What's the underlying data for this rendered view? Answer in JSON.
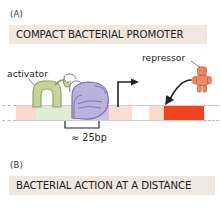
{
  "figure": {
    "width": 221,
    "height": 209,
    "background": "#ffffff"
  },
  "panels": [
    {
      "id": "A",
      "letter": "(A)",
      "banner_text": "COMPACT BACTERIAL PROMOTER",
      "banner_color": "#f0e7df"
    },
    {
      "id": "B",
      "letter": "(B)",
      "banner_text": "BACTERIAL ACTION AT A DISTANCE",
      "banner_color": "#f0e7df"
    }
  ],
  "diagram": {
    "labels": {
      "activator": "activator",
      "repressor": "repressor",
      "spacing": "≈ 25bp"
    },
    "dna_segments": [
      {
        "name": "upstream-peach",
        "color": "#fbd9c8",
        "width": 20
      },
      {
        "name": "activator-site",
        "color": "#e2eed4",
        "width": 36
      },
      {
        "name": "spacer-pink",
        "color": "#f7e2db",
        "width": 9
      },
      {
        "name": "promoter-purple",
        "color": "#c9c3e4",
        "width": 28
      },
      {
        "name": "spacer-pink-2",
        "color": "#f8ded2",
        "width": 12
      },
      {
        "name": "downstream-peach",
        "color": "#fbe0d0",
        "width": 11
      },
      {
        "name": "white-gap",
        "color": "#ffffff",
        "width": 17
      },
      {
        "name": "operator-peach",
        "color": "#fbdcc9",
        "width": 15
      },
      {
        "name": "gene-block-red",
        "color": "#f0441f",
        "width": 40
      }
    ],
    "colors": {
      "activator_fill": "#c4d49a",
      "activator_stroke": "#8aa35a",
      "polymerase_fill": "#b9b2dd",
      "polymerase_stroke": "#7a72ad",
      "repressor_fill": "#f08a62",
      "repressor_stroke": "#c85f36",
      "gene_red": "#f0441f",
      "arrow_black": "#231f20",
      "dash_line": "#b9b4cf"
    }
  }
}
